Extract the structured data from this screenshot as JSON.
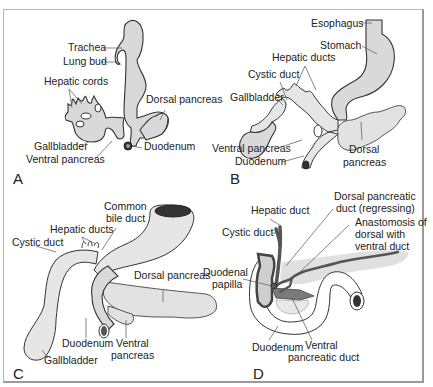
{
  "figure": {
    "panels": [
      {
        "letter": "A",
        "labels": [
          "Trachea",
          "Lung bud",
          "Hepatic cords",
          "Dorsal pancreas",
          "Gallbladder",
          "Ventral pancreas",
          "Duodenum"
        ]
      },
      {
        "letter": "B",
        "labels": [
          "Esophagus",
          "Stomach",
          "Hepatic ducts",
          "Cystic duct",
          "Gallbladder",
          "Ventral pancreas",
          "Duodenum",
          "Dorsal",
          "pancreas"
        ]
      },
      {
        "letter": "C",
        "labels": [
          "Common",
          "bile duct",
          "Hepatic ducts",
          "Cystic duct",
          "Dorsal pancreas",
          "Duodenum",
          "Ventral",
          "pancreas",
          "Gallbladder"
        ]
      },
      {
        "letter": "D",
        "labels": [
          "Hepatic duct",
          "Dorsal pancreatic",
          "duct (regressing)",
          "Cystic duct",
          "Anastomosis of",
          "dorsal with",
          "ventral duct",
          "Duodenal",
          "papilla",
          "Duodenum",
          "Ventral",
          "pancreatic duct"
        ]
      }
    ]
  }
}
